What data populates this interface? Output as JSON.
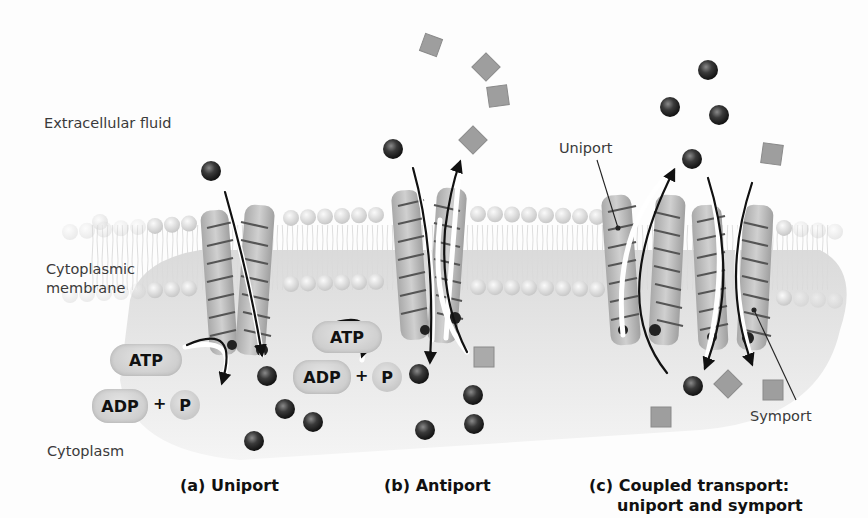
{
  "regions": {
    "extracellular": "Extracellular fluid",
    "membrane_line1": "Cytoplasmic",
    "membrane_line2": "membrane",
    "cytoplasm": "Cytoplasm"
  },
  "panels": [
    {
      "id": "a",
      "caption": "(a) Uniport",
      "atp": "ATP",
      "adp": "ADP",
      "plus": "+",
      "p": "P"
    },
    {
      "id": "b",
      "caption": "(b) Antiport",
      "atp": "ATP",
      "adp": "ADP",
      "plus": "+",
      "p": "P"
    },
    {
      "id": "c",
      "caption_line1": "(c) Coupled transport:",
      "caption_line2": "uniport and symport",
      "callout_uniport": "Uniport",
      "callout_symport": "Symport"
    }
  ],
  "colors": {
    "ion": "#2b2b2b",
    "solute": "#9a9a9a",
    "protein": "#bdbdbd",
    "lipid_head": "#e2e2e2",
    "arrow": "#111111"
  },
  "legend_shapes": {
    "sphere": "transported-ion",
    "square": "transported-solute"
  }
}
